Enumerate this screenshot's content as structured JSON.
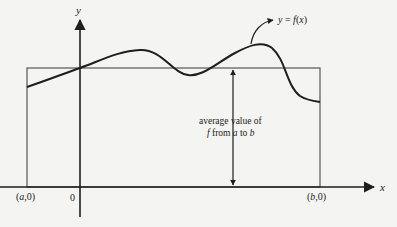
{
  "figure": {
    "axes": {
      "x_label": "x",
      "y_label": "y",
      "origin_label": "0"
    },
    "points": {
      "a_label_open": "(",
      "a_var": "a",
      "a_label_close": ",0)",
      "b_label_open": "(",
      "b_var": "b",
      "b_label_close": ",0)"
    },
    "curve_label": {
      "y": "y",
      "eq": " = ",
      "f": "f",
      "x_open": "(",
      "x": "x",
      "x_close": ")"
    },
    "avg_label": {
      "line1": "average value of",
      "line2_f": "f",
      "line2_from": " from ",
      "line2_a": "a",
      "line2_to": " to ",
      "line2_b": "b"
    },
    "colors": {
      "background": "#f4f4f2",
      "stroke": "#1e1e1e",
      "rectangle": "#555555"
    }
  }
}
